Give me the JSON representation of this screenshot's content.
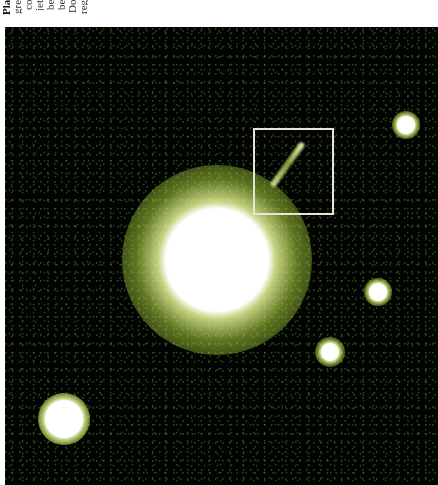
{
  "caption": {
    "lines": [
      {
        "text": "Pla",
        "bold": true
      },
      {
        "text": "gre",
        "bold": false
      },
      {
        "text": "co",
        "bold": false
      },
      {
        "text": "jet",
        "bold": false
      },
      {
        "text": "be",
        "bold": false
      },
      {
        "text": "be",
        "bold": false
      },
      {
        "text": "Do",
        "bold": false
      },
      {
        "text": "reg",
        "bold": false
      }
    ]
  },
  "image": {
    "subject": "quasar-with-jet",
    "background_color": "#020402",
    "glow_color": "#b8d840",
    "core_color": "#ffffff",
    "highlight_box_color": "#e8e4d8",
    "objects": [
      {
        "name": "quasar-core",
        "x": 217,
        "y": 260,
        "r": 36,
        "halo": 95
      },
      {
        "name": "bright-star-bottom-left",
        "x": 64,
        "y": 419,
        "r": 13,
        "halo": 26
      },
      {
        "name": "source-top-right",
        "x": 406,
        "y": 125,
        "r": 6,
        "halo": 14
      },
      {
        "name": "source-right",
        "x": 378,
        "y": 292,
        "r": 6,
        "halo": 14
      },
      {
        "name": "source-lower-right",
        "x": 330,
        "y": 352,
        "r": 6,
        "halo": 15
      }
    ],
    "highlight_box": {
      "x": 253,
      "y": 128,
      "w": 77,
      "h": 83
    },
    "jet": {
      "x1": 272,
      "y1": 186,
      "x2": 303,
      "y2": 143
    }
  }
}
